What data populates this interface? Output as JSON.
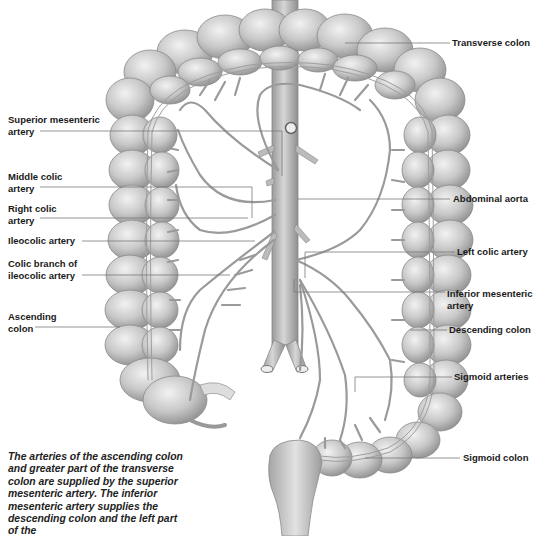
{
  "diagram": {
    "labels_left": [
      {
        "id": "superior-mesenteric-artery",
        "line1": "Superior mesenteric",
        "line2": "artery"
      },
      {
        "id": "middle-colic-artery",
        "line1": "Middle colic",
        "line2": "artery"
      },
      {
        "id": "right-colic-artery",
        "line1": "Right colic",
        "line2": "artery"
      },
      {
        "id": "ileocolic-artery",
        "line1": "Ileocolic artery",
        "line2": ""
      },
      {
        "id": "colic-branch-ileocolic",
        "line1": "Colic branch of",
        "line2": "ileocolic artery"
      },
      {
        "id": "ascending-colon",
        "line1": "Ascending",
        "line2": "colon"
      }
    ],
    "labels_right": [
      {
        "id": "transverse-colon",
        "line1": "Transverse colon",
        "line2": ""
      },
      {
        "id": "abdominal-aorta",
        "line1": "Abdominal aorta",
        "line2": ""
      },
      {
        "id": "left-colic-artery",
        "line1": "Left colic artery",
        "line2": ""
      },
      {
        "id": "inferior-mesenteric-artery",
        "line1": "Inferior mesenteric",
        "line2": "artery"
      },
      {
        "id": "descending-colon",
        "line1": "Descending colon",
        "line2": ""
      },
      {
        "id": "sigmoid-arteries",
        "line1": "Sigmoid arteries",
        "line2": ""
      },
      {
        "id": "sigmoid-colon",
        "line1": "Sigmoid colon",
        "line2": ""
      }
    ],
    "caption": "The arteries of the ascending colon and greater part of the transverse colon are supplied by the superior mesenteric artery. The inferior mesenteric artery supplies the descending colon and the left part of the",
    "colors": {
      "colon_fill": "#c9c9c9",
      "colon_highlight": "#e8e8e8",
      "colon_shadow": "#9a9a9a",
      "vessel_fill": "#bdbdbd",
      "vessel_stroke": "#8a8a8a",
      "leader_line": "#7a7a7a",
      "text": "#1a1a1a"
    }
  }
}
